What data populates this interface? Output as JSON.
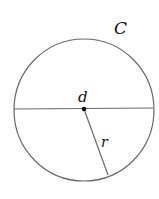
{
  "diagram": {
    "labels": {
      "circle": "C",
      "diameter": "d",
      "radius": "r"
    },
    "colors": {
      "stroke": "#6a6a6a",
      "center_dot": "#111111",
      "text": "#111111",
      "background": "#ffffff"
    }
  }
}
